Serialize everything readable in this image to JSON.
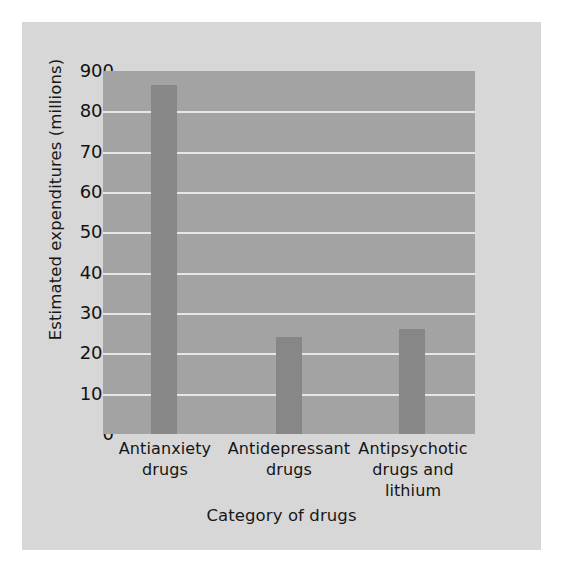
{
  "chart_data": {
    "type": "bar",
    "title": "",
    "xlabel": "Category of drugs",
    "ylabel": "Estimated expenditures (millions)",
    "categories": [
      "Antianxiety drugs",
      "Antidepressant drugs",
      "Antipsychotic drugs and lithium"
    ],
    "category_lines": [
      [
        "Antianxiety",
        "drugs"
      ],
      [
        "Antidepressant",
        "drugs"
      ],
      [
        "Antipsychotic",
        "drugs and",
        "lithium"
      ]
    ],
    "values": [
      865,
      240,
      260
    ],
    "ylim": [
      0,
      900
    ],
    "ytick_labels": [
      "900",
      "800",
      "700",
      "600",
      "500",
      "400",
      "300",
      "200",
      "100",
      "0"
    ],
    "ytick_values": [
      900,
      800,
      700,
      600,
      500,
      400,
      300,
      200,
      100,
      0
    ],
    "ytick_step": 100,
    "grid": "horizontal",
    "legend": "none",
    "colors": {
      "figure_background": "#d7d7d7",
      "plot_background": "#a3a3a3",
      "bar": "#878787",
      "gridline": "#e6e6e6",
      "text": "#141414",
      "outer_background": "#ffffff"
    }
  }
}
